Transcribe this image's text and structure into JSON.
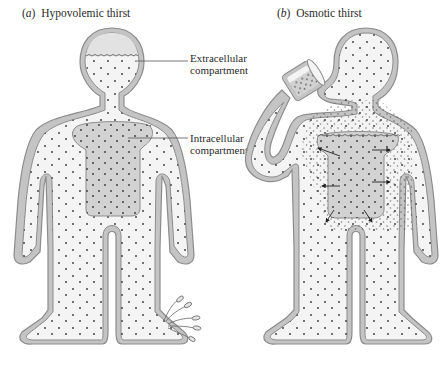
{
  "figure": {
    "panels": [
      {
        "id": "a",
        "letter": "a",
        "title": "Hypovolemic thirst"
      },
      {
        "id": "b",
        "letter": "b",
        "title": "Osmotic thirst"
      }
    ],
    "labels": {
      "extracellular_line1": "Extracellular",
      "extracellular_line2": "compartment",
      "intracellular_line1": "Intracellular",
      "intracellular_line2": "compartment"
    },
    "colors": {
      "outline": "#8c8c8c",
      "wall_fill": "#c4c4c4",
      "fluid_fill": "#f4f4f4",
      "intracellular_fill": "#d2d2d2",
      "dots": "#333333"
    }
  }
}
